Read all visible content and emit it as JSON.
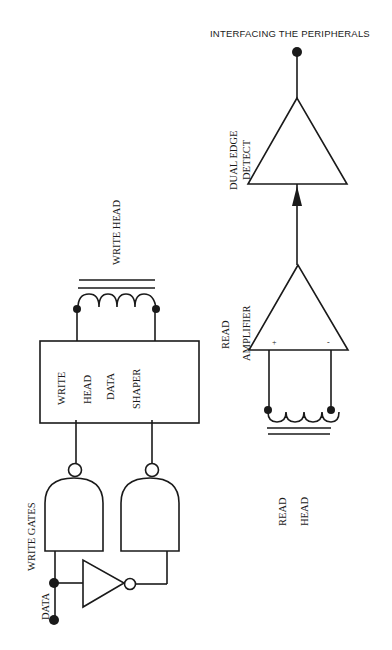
{
  "header": {
    "title": "INTERFACING THE PERIPHERALS"
  },
  "labels": {
    "dual_edge_detect_line1": "DUAL EDGE",
    "dual_edge_detect_line2": "DETECT",
    "write_head": "WRITE HEAD",
    "read_amplifier_line1": "READ",
    "read_amplifier_line2": "AMPLIFIER",
    "amp_plus": "+",
    "amp_minus": "-",
    "shaper_line1": "WRITE",
    "shaper_line2": "HEAD",
    "shaper_line3": "DATA",
    "shaper_line4": "SHAPER",
    "write_gates": "WRITE GATES",
    "data": "DATA",
    "read_head_line1": "READ",
    "read_head_line2": "HEAD"
  },
  "colors": {
    "ink": "#1a1a1a",
    "paper": "#ffffff"
  }
}
